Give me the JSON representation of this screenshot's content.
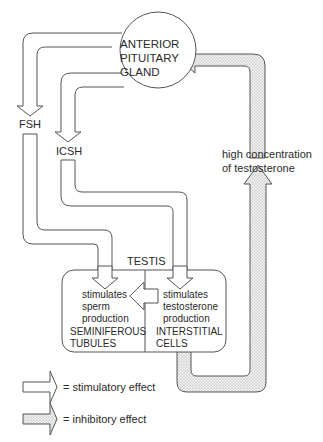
{
  "diagram": {
    "nodes": {
      "pituitary": {
        "line1": "ANTERIOR",
        "line2": "PITUITARY",
        "line3": "GLAND"
      },
      "fsh": "FSH",
      "icsh": "ICSH",
      "testosterone": {
        "line1": "high concentration",
        "line2": "of testosterone"
      },
      "testis": "TESTIS",
      "seminiferous": {
        "effect1": "stimulates",
        "effect2": "sperm",
        "effect3": "production",
        "name1": "SEMINIFEROUS",
        "name2": "TUBULES"
      },
      "interstitial": {
        "effect1": "stimulates",
        "effect2": "testosterone",
        "effect3": "production",
        "name1": "INTERSTITIAL",
        "name2": "CELLS"
      }
    },
    "edges": [
      {
        "from": "ANTERIOR PITUITARY GLAND",
        "to": "FSH",
        "type": "stimulatory"
      },
      {
        "from": "FSH",
        "to": "SEMINIFEROUS TUBULES",
        "type": "stimulatory"
      },
      {
        "from": "ANTERIOR PITUITARY GLAND",
        "to": "ICSH",
        "type": "stimulatory"
      },
      {
        "from": "ICSH",
        "to": "INTERSTITIAL CELLS",
        "type": "stimulatory"
      },
      {
        "from": "INTERSTITIAL CELLS",
        "to": "SEMINIFEROUS TUBULES",
        "type": "stimulatory"
      },
      {
        "from": "INTERSTITIAL CELLS",
        "to": "high concentration of testosterone",
        "type": "inhibitory"
      },
      {
        "from": "high concentration of testosterone",
        "to": "ANTERIOR PITUITARY GLAND",
        "type": "inhibitory"
      }
    ],
    "legend": {
      "stimulatory": "= stimulatory effect",
      "inhibitory": "= inhibitory effect"
    },
    "colors": {
      "stroke": "#555555",
      "text": "#2a2a2a",
      "inhibitory_fill": "#e6e6e6",
      "background": "#ffffff"
    }
  }
}
